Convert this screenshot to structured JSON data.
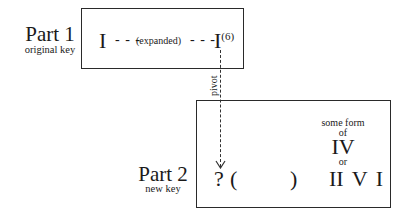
{
  "part1": {
    "title": "Part 1",
    "subtitle": "original key",
    "start_chord": "I",
    "dashes_left": "- - -",
    "middle_label": "(expanded)",
    "dashes_right": "- - -",
    "end_chord": "I",
    "end_chord_superscript": "(6)"
  },
  "connector": {
    "label": "pivot",
    "style": "dashed-arrow-down"
  },
  "part2": {
    "title": "Part 2",
    "subtitle": "new key",
    "pivot_chord": "?",
    "open_paren": "(",
    "close_paren": ")",
    "predominant_caption_1": "some form",
    "predominant_caption_2": "of",
    "option_1": "IV",
    "or_label": "or",
    "cadence": "II V I"
  },
  "colors": {
    "stroke": "#2a2a2a",
    "text": "#1a1a1a",
    "background": "#ffffff"
  }
}
